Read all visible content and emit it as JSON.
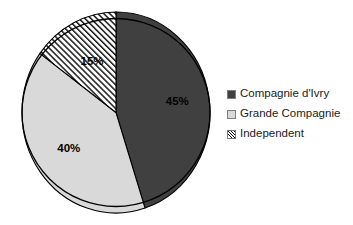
{
  "chart_data": {
    "type": "pie",
    "title": "",
    "labels": [
      "Compagnie d'Ivry",
      "Grande Compagnie",
      "Independent"
    ],
    "values": [
      45,
      40,
      15
    ],
    "value_labels": [
      "45%",
      "40%",
      "15%"
    ],
    "units": "percent",
    "start_angle_deg": 0,
    "direction": "clockwise",
    "legend_position": "right",
    "grid": false,
    "colors": [
      "#404040",
      "#d9d9d9",
      "#ffffff"
    ],
    "fill_patterns": [
      "solid",
      "solid",
      "diagonal-hatch"
    ],
    "slices": [
      {
        "label": "Compagnie d'Ivry",
        "value": 45,
        "value_label": "45%",
        "color": "#404040",
        "pattern": "solid",
        "start_deg": 0,
        "end_deg": 162
      },
      {
        "label": "Grande Compagnie",
        "value": 40,
        "value_label": "40%",
        "color": "#d9d9d9",
        "pattern": "solid",
        "start_deg": 162,
        "end_deg": 306
      },
      {
        "label": "Independent",
        "value": 15,
        "value_label": "15%",
        "color": "#ffffff",
        "pattern": "diagonal-hatch",
        "start_deg": 306,
        "end_deg": 360
      }
    ]
  },
  "legend": {
    "items": [
      {
        "label": "Compagnie d'Ivry",
        "swatch": "solid-dark"
      },
      {
        "label": "Grande Compagnie",
        "swatch": "solid-light"
      },
      {
        "label": "Independent",
        "swatch": "hatched"
      }
    ]
  },
  "style": {
    "outline_color": "#000000",
    "background": "#ffffff",
    "dark_fill": "#404040",
    "light_fill": "#d9d9d9",
    "hatch_fill": "#ffffff"
  }
}
